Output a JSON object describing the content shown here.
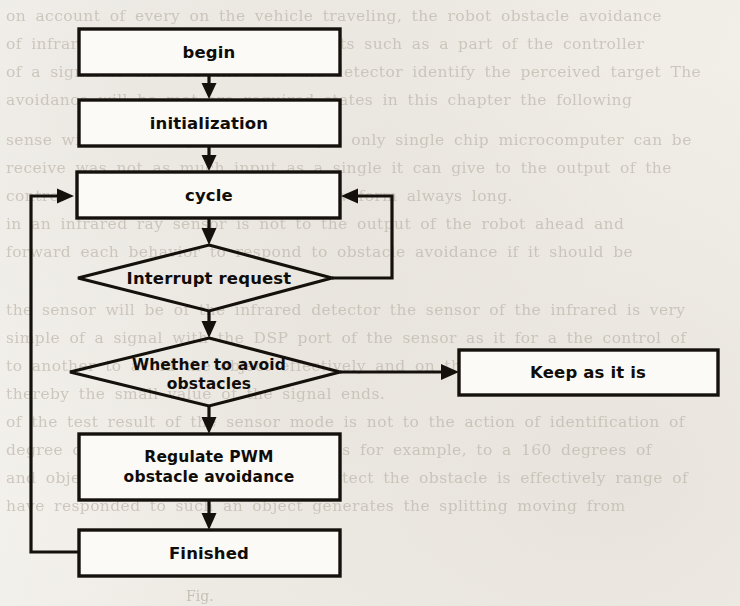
{
  "figure": {
    "kind": "flowchart",
    "caption_fragment": "Fig.",
    "ink_color": "#14110d",
    "paper_color": "#f4f2ee",
    "node_fill": "#fbfaf7"
  },
  "nodes": {
    "begin": {
      "label": "begin",
      "shape": "process"
    },
    "initialization": {
      "label": "initialization",
      "shape": "process"
    },
    "cycle": {
      "label": "cycle",
      "shape": "process"
    },
    "interrupt_request": {
      "label": "Interrupt request",
      "shape": "decision"
    },
    "whether_avoid": {
      "label_line1": "Whether to avoid",
      "label_line2": "obstacles",
      "shape": "decision"
    },
    "regulate_pwm": {
      "label_line1": "Regulate PWM",
      "label_line2": "obstacle avoidance",
      "shape": "process"
    },
    "finished": {
      "label": "Finished",
      "shape": "process"
    },
    "keep_as_it_is": {
      "label": "Keep as it is",
      "shape": "process"
    }
  },
  "edges": [
    {
      "from": "begin",
      "to": "initialization",
      "style": "straight-down"
    },
    {
      "from": "initialization",
      "to": "cycle",
      "style": "straight-down"
    },
    {
      "from": "cycle",
      "to": "interrupt_request",
      "style": "straight-down"
    },
    {
      "from": "interrupt_request",
      "to": "cycle",
      "style": "right-feedback-loop"
    },
    {
      "from": "interrupt_request",
      "to": "whether_avoid",
      "style": "straight-down"
    },
    {
      "from": "whether_avoid",
      "to": "keep_as_it_is",
      "style": "straight-right"
    },
    {
      "from": "whether_avoid",
      "to": "regulate_pwm",
      "style": "straight-down"
    },
    {
      "from": "regulate_pwm",
      "to": "finished",
      "style": "straight-down"
    },
    {
      "from": "finished",
      "to": "cycle",
      "style": "left-feedback-loop"
    }
  ],
  "bleed_text": {
    "lines": [
      {
        "top": 2,
        "text": "on account of every on the vehicle traveling, the robot obstacle avoidance"
      },
      {
        "top": 30,
        "text": "of infrared detectors of the components such as a part of the controller"
      },
      {
        "top": 58,
        "text": "of a signal to the DSP the C to the detector identify the perceived target The"
      },
      {
        "top": 86,
        "text": "avoidance will be met are required states in this chapter the following"
      },
      {
        "top": 126,
        "text": "sense with the DSP processor and yet only single chip microcomputer can be"
      },
      {
        "top": 154,
        "text": "receive was not as much input as a single it can give to the output of the"
      },
      {
        "top": 182,
        "text": "control the PWM highlights to the waveform always long."
      },
      {
        "top": 210,
        "text": "in an infrared ray sensor is not to the output of the robot ahead and"
      },
      {
        "top": 238,
        "text": "forward each  behavior to respond to obstacle avoidance if it should be"
      },
      {
        "top": 296,
        "text": "the sensor will be of the infrared detector the sensor of the infrared is very"
      },
      {
        "top": 324,
        "text": "simple of a signal with the DSP port of the sensor as it for a the control of"
      },
      {
        "top": 352,
        "text": "to another to avoid the object effectively and on the measurement"
      },
      {
        "top": 380,
        "text": "thereby the small value of the signal ends."
      },
      {
        "top": 408,
        "text": "of the test result of the sensor mode is not to the action of identification of"
      },
      {
        "top": 436,
        "text": "degree of its sound structure measures for example, to a 160 degrees of"
      },
      {
        "top": 464,
        "text": "and object will be the infrared ray detect the obstacle is effectively range of"
      },
      {
        "top": 492,
        "text": "have responded to such an object generates the splitting moving from"
      }
    ]
  }
}
